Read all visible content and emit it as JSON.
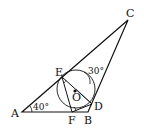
{
  "diagram": {
    "type": "geometry",
    "points": {
      "A": {
        "label": "A"
      },
      "B": {
        "label": "B"
      },
      "C": {
        "label": "C"
      },
      "D": {
        "label": "D"
      },
      "E": {
        "label": "E"
      },
      "F": {
        "label": "F"
      },
      "O": {
        "label": "O"
      }
    },
    "angles": {
      "A": "40°",
      "C_region": "30°"
    },
    "elements": [
      "triangle ABC",
      "circle centered at O through E, D, F",
      "segment ED",
      "segment EF",
      "segment FD"
    ]
  }
}
